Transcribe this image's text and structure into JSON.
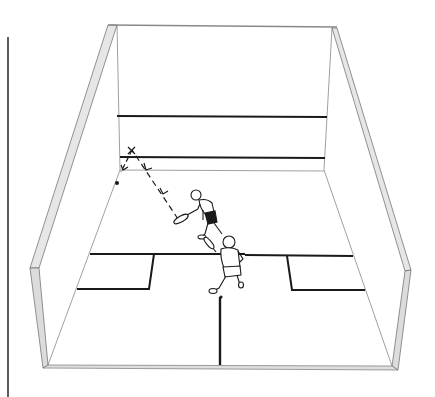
{
  "figure": {
    "colors": {
      "background": "#ffffff",
      "line": "#1a1a1a",
      "thin_line": "#555555",
      "wall_fill": "#d9d9d9"
    },
    "elements": {
      "margin_rule": "left-margin-rule",
      "court": "squash-court",
      "front_wall": "front-wall",
      "players": [
        "player-striking",
        "player-waiting"
      ],
      "ball_path": "dashed-ball-trajectory",
      "bounce_mark": "x-mark-on-front-wall",
      "ball": "ball-dot"
    }
  }
}
